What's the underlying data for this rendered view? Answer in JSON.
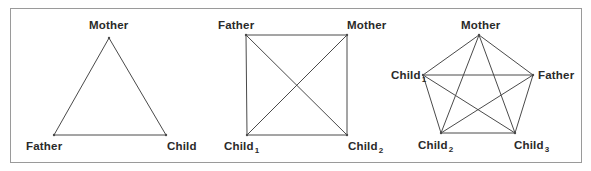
{
  "colors": {
    "line": "#4a4a4a",
    "border": "#9a9a9a",
    "text": "#2a2a2a",
    "background": "#ffffff"
  },
  "diagrams": [
    {
      "name": "triangle",
      "shape": "triangle",
      "members": 3,
      "nodes": [
        {
          "label": "Mother",
          "sub": "",
          "x": 109,
          "y": 38
        },
        {
          "label": "Father",
          "sub": "",
          "x": 54,
          "y": 135
        },
        {
          "label": "Child",
          "sub": "",
          "x": 166,
          "y": 135
        }
      ],
      "edges": [
        [
          0,
          1
        ],
        [
          0,
          2
        ],
        [
          1,
          2
        ]
      ]
    },
    {
      "name": "square",
      "shape": "square",
      "members": 4,
      "nodes": [
        {
          "label": "Father",
          "sub": "",
          "x": 246,
          "y": 35
        },
        {
          "label": "Mother",
          "sub": "",
          "x": 347,
          "y": 35
        },
        {
          "label": "Child",
          "sub": "1",
          "x": 247,
          "y": 135
        },
        {
          "label": "Child",
          "sub": "2",
          "x": 347,
          "y": 135
        }
      ],
      "edges": [
        [
          0,
          1
        ],
        [
          0,
          2
        ],
        [
          0,
          3
        ],
        [
          1,
          2
        ],
        [
          1,
          3
        ],
        [
          2,
          3
        ]
      ]
    },
    {
      "name": "pentagon",
      "shape": "pentagon",
      "members": 5,
      "nodes": [
        {
          "label": "Mother",
          "sub": "",
          "x": 479,
          "y": 35
        },
        {
          "label": "Father",
          "sub": "",
          "x": 533,
          "y": 75
        },
        {
          "label": "Child",
          "sub": "3",
          "x": 515,
          "y": 133
        },
        {
          "label": "Child",
          "sub": "2",
          "x": 441,
          "y": 133
        },
        {
          "label": "Child",
          "sub": "1",
          "x": 423,
          "y": 75
        }
      ],
      "edges": [
        [
          0,
          1
        ],
        [
          0,
          2
        ],
        [
          0,
          3
        ],
        [
          0,
          4
        ],
        [
          1,
          2
        ],
        [
          1,
          3
        ],
        [
          1,
          4
        ],
        [
          2,
          3
        ],
        [
          2,
          4
        ],
        [
          3,
          4
        ]
      ]
    }
  ],
  "labels": {
    "tri_mother": "Mother",
    "tri_father": "Father",
    "tri_child": "Child",
    "sq_father": "Father",
    "sq_mother": "Mother",
    "sq_child1": "Child",
    "sq_child1_sub": "1",
    "sq_child2": "Child",
    "sq_child2_sub": "2",
    "pent_mother": "Mother",
    "pent_father": "Father",
    "pent_child1": "Child",
    "pent_child1_sub": "1",
    "pent_child2": "Child",
    "pent_child2_sub": "2",
    "pent_child3": "Child",
    "pent_child3_sub": "3"
  }
}
